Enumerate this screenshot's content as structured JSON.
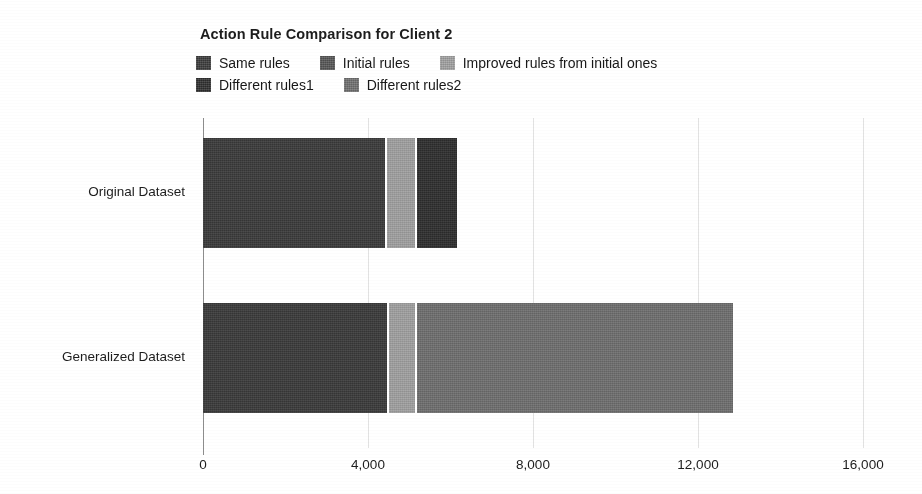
{
  "chart_data": {
    "type": "bar",
    "orientation": "horizontal",
    "stacked": true,
    "title": "Action Rule Comparison for Client 2",
    "xlabel": "",
    "ylabel": "",
    "xlim": [
      0,
      16000
    ],
    "xticks": [
      0,
      4000,
      8000,
      12000,
      16000
    ],
    "xtick_labels": [
      "0",
      "4,000",
      "8,000",
      "12,000",
      "16,000"
    ],
    "grid": true,
    "grid_axis": "x",
    "legend_position": "top",
    "categories": [
      "Original Dataset",
      "Generalized Dataset"
    ],
    "series": [
      {
        "name": "Same rules",
        "color": "#3a3a3a",
        "values": [
          4400,
          4450
        ]
      },
      {
        "name": "Initial rules",
        "color": "#545454",
        "values": [
          0,
          0
        ]
      },
      {
        "name": "Improved rules from initial ones",
        "color": "#a0a0a0",
        "values": [
          700,
          650
        ]
      },
      {
        "name": "Different rules1",
        "color": "#2e2e2e",
        "values": [
          960,
          0
        ]
      },
      {
        "name": "Different rules2",
        "color": "#6e6e6e",
        "values": [
          0,
          7640
        ]
      }
    ],
    "totals": [
      6060,
      12740
    ]
  },
  "title": "Action Rule Comparison for Client 2",
  "legend": {
    "rows": [
      [
        {
          "label": "Same rules",
          "color": "#3a3a3a",
          "gap": 0
        },
        {
          "label": "Initial rules",
          "color": "#545454",
          "gap": 30
        },
        {
          "label": "Improved rules from initial ones",
          "color": "#a0a0a0",
          "gap": 30
        }
      ],
      [
        {
          "label": "Different rules1",
          "color": "#2e2e2e",
          "gap": 0
        },
        {
          "label": "Different rules2",
          "color": "#6e6e6e",
          "gap": 30
        }
      ]
    ]
  },
  "axis": {
    "x": {
      "ticks": [
        {
          "label": "0",
          "value": 0
        },
        {
          "label": "4,000",
          "value": 4000
        },
        {
          "label": "8,000",
          "value": 8000
        },
        {
          "label": "12,000",
          "value": 12000
        },
        {
          "label": "16,000",
          "value": 16000
        }
      ],
      "max": 16000
    },
    "y": {
      "categories": [
        {
          "label": "Original Dataset"
        },
        {
          "label": "Generalized Dataset"
        }
      ]
    }
  },
  "bars": [
    {
      "category": "Original Dataset",
      "top": 20,
      "segments": [
        {
          "series": "Same rules",
          "value": 4400,
          "color": "#3a3a3a"
        },
        {
          "series": "Improved rules from initial ones",
          "value": 700,
          "color": "#a0a0a0"
        },
        {
          "series": "Different rules1",
          "value": 960,
          "color": "#2e2e2e"
        }
      ]
    },
    {
      "category": "Generalized Dataset",
      "top": 185,
      "segments": [
        {
          "series": "Same rules",
          "value": 4450,
          "color": "#3a3a3a"
        },
        {
          "series": "Improved rules from initial ones",
          "value": 650,
          "color": "#a0a0a0"
        },
        {
          "series": "Different rules2",
          "value": 7640,
          "color": "#6e6e6e"
        }
      ]
    }
  ],
  "colors": {
    "background": "#ffffff",
    "axis": "#8d8d8d",
    "grid": "#e2e2e2",
    "text": "#1d1d1d"
  }
}
